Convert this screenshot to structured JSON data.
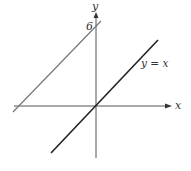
{
  "diagram": {
    "x_axis_label": "x",
    "y_axis_label": "y",
    "intercept_label": "6",
    "line_label": "y = x",
    "lines": [
      {
        "name": "y = x",
        "slope": 1,
        "intercept": 0,
        "color": "#222222"
      },
      {
        "name": "y = x + 6",
        "slope": 1,
        "intercept": 6,
        "color": "#777777"
      }
    ]
  }
}
